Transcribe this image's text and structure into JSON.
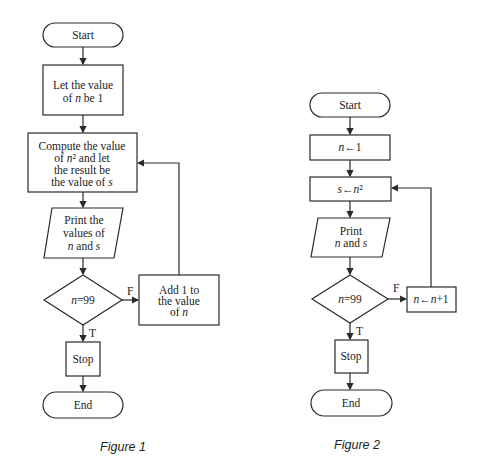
{
  "figure1": {
    "caption": "Figure 1",
    "start": "Start",
    "init": [
      "Let the value",
      "of n be 1"
    ],
    "compute": [
      "Compute the value",
      "of n² and let",
      "the result be",
      "the value of s"
    ],
    "print": [
      "Print the",
      "values of",
      "n and s"
    ],
    "decision": "n=99",
    "false_label": "F",
    "true_label": "T",
    "increment": [
      "Add 1 to",
      "the value",
      "of n"
    ],
    "stop": "Stop",
    "end": "End"
  },
  "figure2": {
    "caption": "Figure 2",
    "start": "Start",
    "init": "n←1",
    "compute": "s←n²",
    "print": [
      "Print",
      "n and s"
    ],
    "decision": "n=99",
    "false_label": "F",
    "true_label": "T",
    "increment": "n←n+1",
    "stop": "Stop",
    "end": "End"
  }
}
